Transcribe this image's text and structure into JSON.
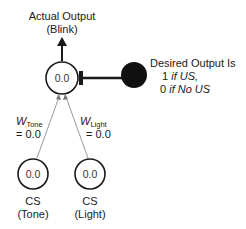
{
  "output_node": {
    "label_line1": "Actual Output",
    "label_line2": "(Blink)",
    "value": "0.0"
  },
  "teacher": {
    "title": "Desired Output Is",
    "line1_num": "1",
    "line1_text": "if US,",
    "line2_num": "0",
    "line2_text": "if No US"
  },
  "weights": {
    "tone": {
      "symbol": "W",
      "sub": "Tone",
      "value": "= 0.0"
    },
    "light": {
      "symbol": "W",
      "sub": "Light",
      "value": "= 0.0"
    }
  },
  "input_nodes": [
    {
      "value": "0.0",
      "label_line1": "CS",
      "label_line2": "(Tone)"
    },
    {
      "value": "0.0",
      "label_line1": "CS",
      "label_line2": "(Light)"
    }
  ],
  "colors": {
    "stroke": "#1a1a1a",
    "connection": "#9a9a9a",
    "teacher_fill": "#111111"
  }
}
